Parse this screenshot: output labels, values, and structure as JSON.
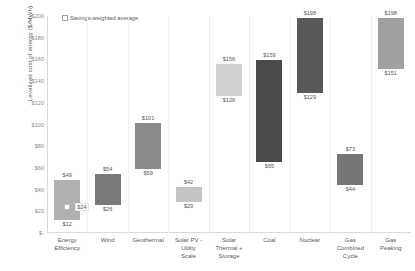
{
  "chart_data": {
    "type": "bar",
    "subtype": "floating-range-bar",
    "title": "",
    "xlabel": "",
    "ylabel": "Levelized cost of energy ($/MWh)",
    "ylim": [
      0,
      200
    ],
    "ytick_step": 20,
    "ytick_labels": [
      "$200",
      "$180",
      "$160",
      "$140",
      "$120",
      "$100",
      "$80",
      "$60",
      "$40",
      "$20",
      "$-"
    ],
    "ytick_values": [
      200,
      180,
      160,
      140,
      120,
      100,
      80,
      60,
      40,
      20,
      0
    ],
    "grid": false,
    "legend_position": "top-left",
    "legend": [
      {
        "name": "Savings-weighted average",
        "marker": "white-diamond"
      }
    ],
    "categories": [
      "Energy Efficiency",
      "Wind",
      "Geothermal",
      "Solar PV - Utility Scale",
      "Solar Thermal + Storage",
      "Coal",
      "Nuclear",
      "Gas Combined Cycle",
      "Gas Peaking"
    ],
    "category_lines": [
      [
        "Energy",
        "Efficiency"
      ],
      [
        "Wind"
      ],
      [
        "Geothermal"
      ],
      [
        "Solar PV -",
        "Utility",
        "Scale"
      ],
      [
        "Solar",
        "Thermal +",
        "Storage"
      ],
      [
        "Coal"
      ],
      [
        "Nuclear"
      ],
      [
        "Gas",
        "Combined",
        "Cycle"
      ],
      [
        "Gas",
        "Peaking"
      ]
    ],
    "low": [
      12,
      26,
      59,
      29,
      126,
      65,
      129,
      44,
      151
    ],
    "high": [
      49,
      54,
      101,
      42,
      156,
      159,
      198,
      73,
      198
    ],
    "low_labels": [
      "$12",
      "$26",
      "$59",
      "$29",
      "$126",
      "$65",
      "$129",
      "$44",
      "$151"
    ],
    "high_labels": [
      "$49",
      "$54",
      "$101",
      "$42",
      "$156",
      "$159",
      "$198",
      "$73",
      "$198"
    ],
    "bar_colors": [
      "#b0b0b0",
      "#7a7a7a",
      "#8a8a8a",
      "#c4c4c4",
      "#cfcfcf",
      "#4a4a4a",
      "#595959",
      "#767676",
      "#a0a0a0"
    ],
    "annotations": [
      {
        "category": "Energy Efficiency",
        "series": "Savings-weighted average",
        "value": 24,
        "label": "$24"
      }
    ]
  }
}
